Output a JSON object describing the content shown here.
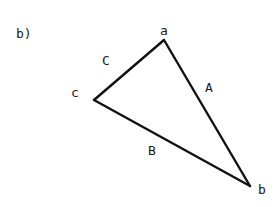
{
  "figure": {
    "caption": "b)",
    "colors": {
      "stroke": "#111111",
      "text": "#1a1a1a",
      "background": "#ffffff"
    },
    "vertices": [
      {
        "id": "a",
        "label": "a",
        "x": 164,
        "y": 40,
        "label_x": 160,
        "label_y": 35
      },
      {
        "id": "b",
        "label": "b",
        "x": 250,
        "y": 186,
        "label_x": 258,
        "label_y": 194
      },
      {
        "id": "c",
        "label": "c",
        "x": 94,
        "y": 100,
        "label_x": 71,
        "label_y": 97
      }
    ],
    "edges": [
      {
        "id": "A",
        "label": "A",
        "from": "a",
        "to": "b",
        "label_x": 205,
        "label_y": 92
      },
      {
        "id": "B",
        "label": "B",
        "from": "c",
        "to": "b",
        "label_x": 148,
        "label_y": 155
      },
      {
        "id": "C",
        "label": "C",
        "from": "c",
        "to": "a",
        "label_x": 102,
        "label_y": 65
      }
    ]
  }
}
